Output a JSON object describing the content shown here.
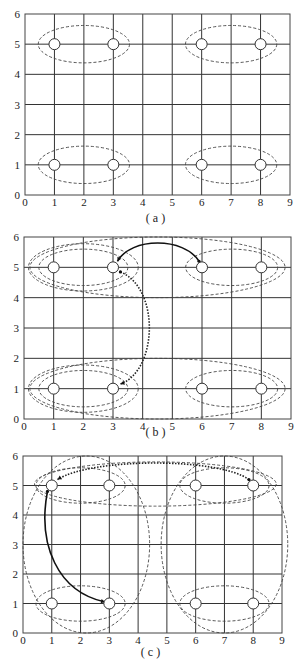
{
  "figure": {
    "panels": [
      {
        "id": "a",
        "caption": "( a )",
        "px": {
          "x0": 25,
          "x9": 290,
          "y6": 14,
          "y0": 195,
          "caption_y": 222
        },
        "x_ticks": [
          "0",
          "1",
          "2",
          "3",
          "4",
          "5",
          "6",
          "7",
          "8",
          "9"
        ],
        "y_ticks": [
          "0",
          "1",
          "2",
          "3",
          "4",
          "5",
          "6"
        ],
        "nodes": [
          [
            1,
            5
          ],
          [
            3,
            5
          ],
          [
            6,
            5
          ],
          [
            8,
            5
          ],
          [
            1,
            1
          ],
          [
            3,
            1
          ],
          [
            6,
            1
          ],
          [
            8,
            1
          ]
        ],
        "clusters": [
          {
            "cx": 2,
            "cy": 5,
            "rx": 1.55,
            "ry": 0.62
          },
          {
            "cx": 7,
            "cy": 5,
            "rx": 1.55,
            "ry": 0.62
          },
          {
            "cx": 2,
            "cy": 1,
            "rx": 1.55,
            "ry": 0.62
          },
          {
            "cx": 7,
            "cy": 1,
            "rx": 1.55,
            "ry": 0.62
          }
        ],
        "arrows": []
      },
      {
        "id": "b",
        "caption": "( b )",
        "px": {
          "x0": 24,
          "x9": 291,
          "y6": 237,
          "y0": 419,
          "caption_y": 436
        },
        "x_ticks": [
          "0",
          "1",
          "2",
          "3",
          "4",
          "5",
          "6",
          "7",
          "8",
          "9"
        ],
        "y_ticks": [
          "0",
          "1",
          "2",
          "3",
          "4",
          "5",
          "6"
        ],
        "nodes": [
          [
            1,
            5
          ],
          [
            3,
            5
          ],
          [
            6,
            5
          ],
          [
            8,
            5
          ],
          [
            1,
            1
          ],
          [
            3,
            1
          ],
          [
            6,
            1
          ],
          [
            8,
            1
          ]
        ],
        "clusters": [
          {
            "cx": 2,
            "cy": 5,
            "rx": 1.5,
            "ry": 0.6
          },
          {
            "cx": 7,
            "cy": 5,
            "rx": 1.55,
            "ry": 0.6
          },
          {
            "cx": 2,
            "cy": 1,
            "rx": 1.5,
            "ry": 0.6
          },
          {
            "cx": 7,
            "cy": 1,
            "rx": 1.55,
            "ry": 0.6
          },
          {
            "cx": 4.5,
            "cy": 5,
            "rx": 4.3,
            "ry": 1.0
          },
          {
            "cx": 4.5,
            "cy": 1,
            "rx": 4.3,
            "ry": 1.0
          },
          {
            "cx": 2.0,
            "cy": 5,
            "rx": 1.85,
            "ry": 0.78
          },
          {
            "cx": 2.0,
            "cy": 1,
            "rx": 1.85,
            "ry": 0.78
          }
        ],
        "arrows": [
          {
            "style": "solid",
            "from": [
              5.9,
              5.2
            ],
            "to": [
              3.15,
              5.2
            ],
            "ctrl": [
              [
                5.4,
                6.0
              ],
              [
                3.6,
                6.0
              ]
            ]
          },
          {
            "style": "dotted",
            "from": [
              3.25,
              4.85
            ],
            "to": [
              3.25,
              1.15
            ],
            "ctrl": [
              [
                4.6,
                4.3
              ],
              [
                4.5,
                1.6
              ]
            ]
          }
        ]
      },
      {
        "id": "c",
        "caption": "( c )",
        "px": {
          "x0": 23,
          "x9": 282,
          "y6": 456,
          "y0": 633,
          "caption_y": 656
        },
        "x_ticks": [
          "0",
          "1",
          "2",
          "3",
          "4",
          "5",
          "6",
          "7",
          "8",
          "9"
        ],
        "y_ticks": [
          "0",
          "1",
          "2",
          "3",
          "4",
          "5",
          "6"
        ],
        "nodes": [
          [
            1,
            5
          ],
          [
            3,
            5
          ],
          [
            6,
            5
          ],
          [
            8,
            5
          ],
          [
            1,
            1
          ],
          [
            3,
            1
          ],
          [
            6,
            1
          ],
          [
            8,
            1
          ]
        ],
        "clusters": [
          {
            "cx": 2,
            "cy": 5,
            "rx": 1.55,
            "ry": 0.6
          },
          {
            "cx": 7,
            "cy": 5,
            "rx": 1.55,
            "ry": 0.6
          },
          {
            "cx": 2,
            "cy": 1,
            "rx": 1.55,
            "ry": 0.6
          },
          {
            "cx": 7,
            "cy": 1,
            "rx": 1.55,
            "ry": 0.6
          },
          {
            "cx": 2.2,
            "cy": 3,
            "rx": 2.2,
            "ry": 3.0
          },
          {
            "cx": 7.0,
            "cy": 3,
            "rx": 2.2,
            "ry": 3.0
          },
          {
            "cx": 4.6,
            "cy": 5.05,
            "rx": 4.2,
            "ry": 0.75
          }
        ],
        "arrows": [
          {
            "style": "solid",
            "from": [
              0.85,
              4.8
            ],
            "to": [
              2.85,
              1.05
            ],
            "ctrl": [
              [
                0.5,
                3.0
              ],
              [
                1.2,
                1.4
              ]
            ]
          },
          {
            "style": "dotted",
            "from": [
              7.85,
              5.2
            ],
            "to": [
              1.2,
              5.2
            ],
            "ctrl": [
              [
                6.8,
                5.95
              ],
              [
                2.4,
                5.95
              ]
            ]
          }
        ]
      }
    ]
  }
}
